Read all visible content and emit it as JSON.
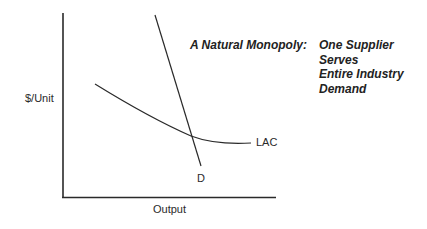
{
  "diagram": {
    "title_prefix": "A Natural Monopoly:",
    "title_lines": [
      "One Supplier",
      "Serves",
      "Entire Industry",
      "Demand"
    ],
    "y_axis_label": "$/Unit",
    "x_axis_label": "Output",
    "curves": {
      "lac_label": "LAC",
      "demand_label": "D"
    },
    "line_color": "#2a2a2a"
  }
}
